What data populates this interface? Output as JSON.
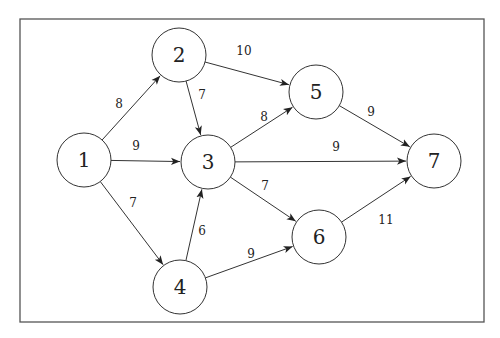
{
  "graph": {
    "directed": true,
    "nodes": [
      {
        "id": "1",
        "label": "1"
      },
      {
        "id": "2",
        "label": "2"
      },
      {
        "id": "3",
        "label": "3"
      },
      {
        "id": "4",
        "label": "4"
      },
      {
        "id": "5",
        "label": "5"
      },
      {
        "id": "6",
        "label": "6"
      },
      {
        "id": "7",
        "label": "7"
      }
    ],
    "edges": [
      {
        "from": "1",
        "to": "2",
        "weight": "8"
      },
      {
        "from": "1",
        "to": "3",
        "weight": "9"
      },
      {
        "from": "1",
        "to": "4",
        "weight": "7"
      },
      {
        "from": "2",
        "to": "3",
        "weight": "7"
      },
      {
        "from": "2",
        "to": "5",
        "weight": "10"
      },
      {
        "from": "3",
        "to": "5",
        "weight": "8"
      },
      {
        "from": "3",
        "to": "7",
        "weight": "9"
      },
      {
        "from": "3",
        "to": "6",
        "weight": "7"
      },
      {
        "from": "4",
        "to": "3",
        "weight": "6"
      },
      {
        "from": "4",
        "to": "6",
        "weight": "9"
      },
      {
        "from": "5",
        "to": "7",
        "weight": "9"
      },
      {
        "from": "6",
        "to": "7",
        "weight": "11"
      }
    ]
  }
}
